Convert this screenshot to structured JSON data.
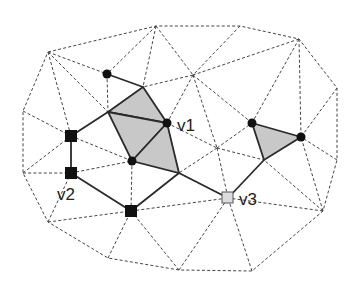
{
  "diagram": {
    "colors": {
      "background": "#ffffff",
      "mesh_edge": "#444444",
      "path_edge": "#2a2a2a",
      "shaded_face": "#c8c8c8",
      "vertex_dark": "#111111",
      "vertex_light": "#dcdcdc"
    },
    "labels": {
      "v1": "v1",
      "v2": "v2",
      "v3": "v3"
    },
    "vertices": {
      "o1": [
        48,
        52
      ],
      "o2": [
        156,
        26
      ],
      "o3": [
        240,
        26
      ],
      "o4": [
        299,
        39
      ],
      "o5": [
        337,
        88
      ],
      "o6": [
        337,
        160
      ],
      "o7": [
        323,
        211
      ],
      "o8": [
        252,
        271
      ],
      "o9": [
        179,
        270
      ],
      "o10": [
        108,
        258
      ],
      "o11": [
        48,
        222
      ],
      "o12": [
        23,
        173
      ],
      "o13": [
        23,
        111
      ],
      "c1": [
        193,
        75
      ],
      "c2": [
        217,
        148
      ],
      "a": [
        107,
        74
      ],
      "b": [
        143,
        87
      ],
      "c": [
        108,
        112
      ],
      "v1": [
        167,
        123
      ],
      "d": [
        132,
        161
      ],
      "e": [
        179,
        173
      ],
      "s1": [
        71,
        136
      ],
      "v2": [
        71,
        173
      ],
      "s3": [
        131,
        211
      ],
      "v3": [
        228,
        198
      ],
      "t1": [
        252,
        123
      ],
      "t2": [
        301,
        137
      ],
      "t3": [
        264,
        160
      ]
    },
    "shaded_faces": [
      [
        "c",
        "b",
        "v1"
      ],
      [
        "c",
        "v1",
        "d"
      ],
      [
        "d",
        "v1",
        "e"
      ],
      [
        "t1",
        "t2",
        "t3"
      ]
    ],
    "path_edges": [
      [
        "a",
        "b"
      ],
      [
        "b",
        "v1"
      ],
      [
        "v1",
        "e"
      ],
      [
        "c",
        "b"
      ],
      [
        "c",
        "v1"
      ],
      [
        "c",
        "d"
      ],
      [
        "d",
        "v1"
      ],
      [
        "d",
        "e"
      ],
      [
        "c",
        "s1"
      ],
      [
        "s1",
        "v2"
      ],
      [
        "v2",
        "s3"
      ],
      [
        "s3",
        "e"
      ],
      [
        "e",
        "v3"
      ],
      [
        "v3",
        "t3"
      ],
      [
        "t1",
        "t2"
      ],
      [
        "t2",
        "t3"
      ],
      [
        "t3",
        "t1"
      ]
    ],
    "dot_vertices": [
      "a",
      "v1",
      "d",
      "t1",
      "t2"
    ],
    "square_vertices_dark": [
      "s1",
      "v2",
      "s3"
    ],
    "square_vertices_light": [
      "v3"
    ]
  }
}
